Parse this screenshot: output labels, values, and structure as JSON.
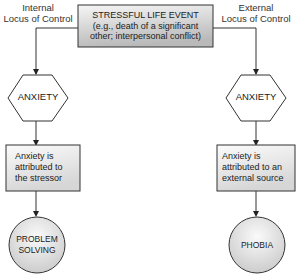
{
  "labels": {
    "left_heading_line1": "Internal",
    "left_heading_line2": "Locus of Control",
    "right_heading_line1": "External",
    "right_heading_line2": "Locus of Control"
  },
  "root": {
    "title": "STRESSFUL LIFE EVENT",
    "line2": "(e.g., death of a significant",
    "line3": "other; interpersonal conflict)"
  },
  "left_branch": {
    "emotion": "ANXIETY",
    "attribution_line1": "Anxiety is",
    "attribution_line2": "attributed to",
    "attribution_line3": "the stressor",
    "outcome_line1": "PROBLEM",
    "outcome_line2": "SOLVING"
  },
  "right_branch": {
    "emotion": "ANXIETY",
    "attribution_line1": "Anxiety is",
    "attribution_line2": "attributed to an",
    "attribution_line3": "external source",
    "outcome_line1": "PHOBIA"
  },
  "colors": {
    "stroke": "#333333",
    "root_gradient_top": "#f4f4f4",
    "root_gradient_bottom": "#bdbdbd",
    "box_gradient_top": "#fafafa",
    "box_gradient_bottom": "#d9d9d9"
  }
}
